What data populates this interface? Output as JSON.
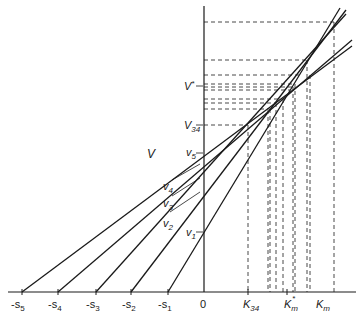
{
  "diagram": {
    "axis_label_v": "V",
    "origin_label": "0",
    "x_labels": {
      "s5": "-s",
      "s5_sub": "5",
      "s4": "-s",
      "s4_sub": "4",
      "s3": "-s",
      "s3_sub": "3",
      "s2": "-s",
      "s2_sub": "2",
      "s1": "-s",
      "s1_sub": "1",
      "k34": "K",
      "k34_sub": "34",
      "kmstar": "K",
      "kmstar_sub": "m",
      "kmstar_sup": "*",
      "km": "K",
      "km_sub": "m"
    },
    "y_labels": {
      "vstar": "V",
      "vstar_sup": "*",
      "v34": "V",
      "v34_sub": "34",
      "v5": "v",
      "v5_sub": "5",
      "v4": "v",
      "v4_sub": "4",
      "v3": "v",
      "v3_sub": "3",
      "v2": "v",
      "v2_sub": "2",
      "v1": "v",
      "v1_sub": "1"
    },
    "lines": [
      {
        "name": "line-1",
        "from_s": "-s1",
        "through_v": "v1"
      },
      {
        "name": "line-2",
        "from_s": "-s2",
        "through_v": "v2"
      },
      {
        "name": "line-3",
        "from_s": "-s3",
        "through_v": "v3"
      },
      {
        "name": "line-4",
        "from_s": "-s4",
        "through_v": "v4"
      },
      {
        "name": "line-5",
        "from_s": "-s5",
        "through_v": "v5"
      }
    ],
    "colors": {
      "ink": "#1a1a1a",
      "background": "#ffffff"
    }
  }
}
